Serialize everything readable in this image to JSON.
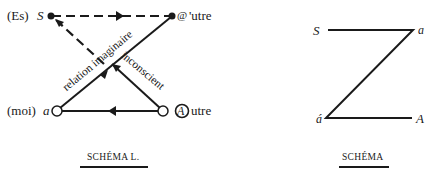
{
  "schema_l": {
    "caption": "SCHÉMA L.",
    "nodes": {
      "es_prefix": "(Es)",
      "S": "S",
      "autre_small_symbol": "@",
      "autre_small_rest": "'utre",
      "moi_prefix": "(moi)",
      "a": "a",
      "Autre_symbol": "A",
      "Autre_rest": "utre"
    },
    "edges": {
      "relation_imaginaire": "relation imaginaire",
      "inconscient": "inconscient"
    }
  },
  "schema_z": {
    "caption": "SCHÉMA",
    "nodes": {
      "S": "S",
      "a": "a",
      "a_prime": "á",
      "A": "A"
    }
  },
  "colors": {
    "ink": "#1a1a1a",
    "background": "#ffffff"
  }
}
